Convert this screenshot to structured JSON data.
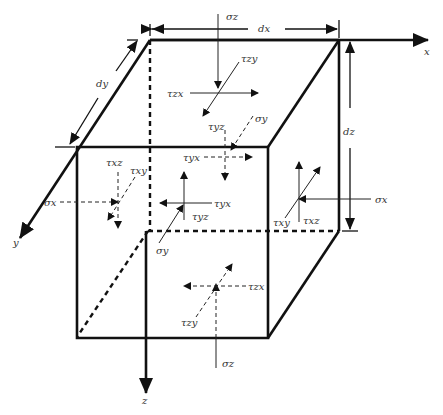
{
  "figure": {
    "axes": {
      "x": "x",
      "y": "y",
      "z": "z"
    },
    "dimensions": {
      "dx": "dx",
      "dy": "dy",
      "dz": "dz"
    },
    "top_face": {
      "normal": "σz",
      "shear_x": "τzx",
      "shear_y": "τzy"
    },
    "back_face": {
      "normal": "σy",
      "shear_z": "τyz",
      "shear_x": "τyx"
    },
    "left_face": {
      "normal": "σx",
      "shear_z": "τxz",
      "shear_y": "τxy"
    },
    "front_face": {
      "normal": "σy",
      "shear_x": "τyx",
      "shear_z": "τyz"
    },
    "right_face": {
      "normal": "σx",
      "shear_y": "τxy",
      "shear_z": "τxz"
    },
    "bottom_face": {
      "normal": "σz",
      "shear_x": "τzx",
      "shear_y": "τzy"
    }
  }
}
